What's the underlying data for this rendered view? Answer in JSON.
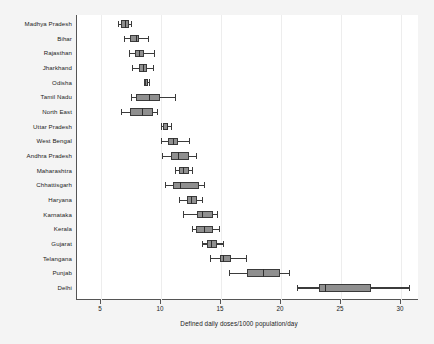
{
  "chart_data": {
    "type": "box",
    "title": "",
    "subtitle": "",
    "xlabel": "Defined daily doses/1000 population/day",
    "ylabel": "",
    "orientation": "horizontal",
    "xlim": [
      3.0,
      31.5
    ],
    "xticks": [
      5,
      10,
      15,
      20,
      25,
      30
    ],
    "xtick_labels": [
      "5",
      "10",
      "15",
      "20",
      "25",
      "30"
    ],
    "grid": "vertical-faint",
    "legend": "none",
    "box_fill_color": "#8f8f8f",
    "box_line_color": "#3a3a3a",
    "frame_color": "#555555",
    "categories": [
      "Madhya Pradesh",
      "Bihar",
      "Rajasthan",
      "Jharkhand",
      "Odisha",
      "Tamil Nadu",
      "North East",
      "Uttar Pradesh",
      "West Bengal",
      "Andhra Pradesh",
      "Maharashtra",
      "Chhattisgarh",
      "Haryana",
      "Karnataka",
      "Kerala",
      "Gujarat",
      "Telangana",
      "Punjab",
      "Delhi"
    ],
    "boxes": [
      {
        "category": "Madhya Pradesh",
        "whisker_low": 6.4,
        "q1": 6.7,
        "median": 7.0,
        "q3": 7.3,
        "whisker_high": 7.5
      },
      {
        "category": "Bihar",
        "whisker_low": 6.9,
        "q1": 7.4,
        "median": 7.9,
        "q3": 8.2,
        "whisker_high": 8.9
      },
      {
        "category": "Rajasthan",
        "whisker_low": 7.3,
        "q1": 7.8,
        "median": 8.2,
        "q3": 8.6,
        "whisker_high": 9.4
      },
      {
        "category": "Jharkhand",
        "whisker_low": 7.6,
        "q1": 8.2,
        "median": 8.5,
        "q3": 8.8,
        "whisker_high": 9.3
      },
      {
        "category": "Odisha",
        "whisker_low": 8.6,
        "q1": 8.7,
        "median": 8.8,
        "q3": 8.9,
        "whisker_high": 9.0
      },
      {
        "category": "Tamil Nadu",
        "whisker_low": 7.5,
        "q1": 7.9,
        "median": 9.0,
        "q3": 9.9,
        "whisker_high": 11.2
      },
      {
        "category": "North East",
        "whisker_low": 6.7,
        "q1": 7.4,
        "median": 8.4,
        "q3": 9.3,
        "whisker_high": 9.7
      },
      {
        "category": "Uttar Pradesh",
        "whisker_low": 10.0,
        "q1": 10.2,
        "median": 10.5,
        "q3": 10.6,
        "whisker_high": 10.8
      },
      {
        "category": "West Bengal",
        "whisker_low": 10.0,
        "q1": 10.6,
        "median": 11.0,
        "q3": 11.4,
        "whisker_high": 12.3
      },
      {
        "category": "Andhra Pradesh",
        "whisker_low": 10.1,
        "q1": 10.8,
        "median": 11.4,
        "q3": 12.3,
        "whisker_high": 12.9
      },
      {
        "category": "Maharashtra",
        "whisker_low": 11.2,
        "q1": 11.5,
        "median": 11.8,
        "q3": 12.3,
        "whisker_high": 12.6
      },
      {
        "category": "Chhattisgarh",
        "whisker_low": 10.3,
        "q1": 11.0,
        "median": 11.6,
        "q3": 13.2,
        "whisker_high": 13.6
      },
      {
        "category": "Haryana",
        "whisker_low": 11.5,
        "q1": 12.2,
        "median": 12.5,
        "q3": 13.0,
        "whisker_high": 13.4
      },
      {
        "category": "Karnataka",
        "whisker_low": 11.8,
        "q1": 13.0,
        "median": 13.4,
        "q3": 14.3,
        "whisker_high": 14.7
      },
      {
        "category": "Kerala",
        "whisker_low": 12.6,
        "q1": 12.9,
        "median": 13.6,
        "q3": 14.3,
        "whisker_high": 14.8
      },
      {
        "category": "Gujarat",
        "whisker_low": 13.4,
        "q1": 13.8,
        "median": 14.2,
        "q3": 14.7,
        "whisker_high": 15.2
      },
      {
        "category": "Telangana",
        "whisker_low": 14.1,
        "q1": 14.9,
        "median": 15.2,
        "q3": 15.8,
        "whisker_high": 17.1
      },
      {
        "category": "Punjab",
        "whisker_low": 15.7,
        "q1": 17.2,
        "median": 18.5,
        "q3": 19.9,
        "whisker_high": 20.7
      },
      {
        "category": "Delhi",
        "whisker_low": 21.3,
        "q1": 23.2,
        "median": 23.7,
        "q3": 27.5,
        "whisker_high": 30.7
      }
    ]
  }
}
